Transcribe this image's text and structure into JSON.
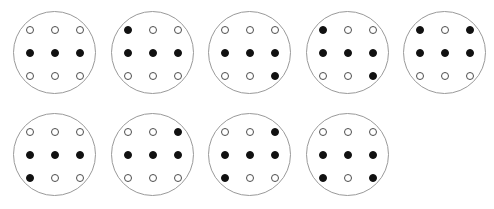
{
  "figure": {
    "name": "dice-face-grid-diagram",
    "width": 494,
    "height": 209,
    "background_color": "#ffffff",
    "circle": {
      "diameter": 83,
      "stroke_color": "#9a9a9a",
      "stroke_width": 1,
      "fill_color": "#ffffff"
    },
    "dot": {
      "diameter": 8,
      "filled_color": "#111111",
      "open_fill_color": "#ffffff",
      "open_stroke_color": "#4d4d4d",
      "grid_columns": 3,
      "grid_rows": 3,
      "column_spacing": 25,
      "row_spacing": 23
    },
    "rows": [
      {
        "row_index": 0,
        "y": 11,
        "circles": [
          {
            "index": 1,
            "label": "circle-1",
            "x": 13,
            "filled_count": 3,
            "open_count": 6,
            "dots": [
              [
                "open",
                "open",
                "open"
              ],
              [
                "filled",
                "filled",
                "filled"
              ],
              [
                "open",
                "open",
                "open"
              ]
            ]
          },
          {
            "index": 2,
            "label": "circle-2",
            "x": 111,
            "filled_count": 4,
            "open_count": 5,
            "dots": [
              [
                "filled",
                "open",
                "open"
              ],
              [
                "filled",
                "filled",
                "filled"
              ],
              [
                "open",
                "open",
                "open"
              ]
            ]
          },
          {
            "index": 3,
            "label": "circle-3",
            "x": 208,
            "filled_count": 4,
            "open_count": 5,
            "dots": [
              [
                "open",
                "open",
                "open"
              ],
              [
                "filled",
                "filled",
                "filled"
              ],
              [
                "open",
                "open",
                "filled"
              ]
            ]
          },
          {
            "index": 4,
            "label": "circle-4",
            "x": 306,
            "filled_count": 5,
            "open_count": 4,
            "dots": [
              [
                "filled",
                "open",
                "open"
              ],
              [
                "filled",
                "filled",
                "filled"
              ],
              [
                "open",
                "open",
                "filled"
              ]
            ]
          },
          {
            "index": 5,
            "label": "circle-5",
            "x": 403,
            "filled_count": 5,
            "open_count": 4,
            "dots": [
              [
                "filled",
                "open",
                "filled"
              ],
              [
                "filled",
                "filled",
                "filled"
              ],
              [
                "open",
                "open",
                "open"
              ]
            ]
          }
        ]
      },
      {
        "row_index": 1,
        "y": 113,
        "circles": [
          {
            "index": 6,
            "label": "circle-6",
            "x": 13,
            "filled_count": 4,
            "open_count": 5,
            "dots": [
              [
                "open",
                "open",
                "open"
              ],
              [
                "filled",
                "filled",
                "filled"
              ],
              [
                "filled",
                "open",
                "open"
              ]
            ]
          },
          {
            "index": 7,
            "label": "circle-7",
            "x": 111,
            "filled_count": 4,
            "open_count": 5,
            "dots": [
              [
                "open",
                "open",
                "filled"
              ],
              [
                "filled",
                "filled",
                "filled"
              ],
              [
                "open",
                "open",
                "open"
              ]
            ]
          },
          {
            "index": 8,
            "label": "circle-8",
            "x": 208,
            "filled_count": 5,
            "open_count": 4,
            "dots": [
              [
                "open",
                "open",
                "filled"
              ],
              [
                "filled",
                "filled",
                "filled"
              ],
              [
                "filled",
                "open",
                "open"
              ]
            ]
          },
          {
            "index": 9,
            "label": "circle-9",
            "x": 306,
            "filled_count": 5,
            "open_count": 4,
            "dots": [
              [
                "open",
                "open",
                "open"
              ],
              [
                "filled",
                "filled",
                "filled"
              ],
              [
                "filled",
                "open",
                "filled"
              ]
            ]
          }
        ]
      }
    ]
  }
}
